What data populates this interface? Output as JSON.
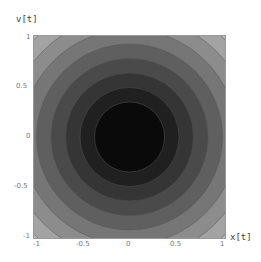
{
  "chart_data": {
    "type": "contour",
    "title": "",
    "xlabel": "x[t]",
    "ylabel": "v[t]",
    "xlim": [
      -1,
      1
    ],
    "ylim": [
      -1,
      1
    ],
    "x_ticks": [
      "-1",
      "-0.5",
      "0",
      "0.5",
      "1"
    ],
    "y_ticks": [
      "1",
      "0.5",
      "0",
      "-0.5",
      "-1"
    ],
    "grid": false,
    "legend": null,
    "function_description": "radially symmetric, minimum at origin (darkest), increasing outward",
    "contour_levels": 10,
    "fill_colors": [
      "#0a0a0a",
      "#202020",
      "#353535",
      "#4a4a4a",
      "#5f5f5f",
      "#767676",
      "#8c8c8c",
      "#a3a3a3",
      "#bababa",
      "#d2d2d2",
      "#e9e9e9"
    ]
  },
  "axes": {
    "x_label": "x[t]",
    "y_label": "v[t]"
  }
}
